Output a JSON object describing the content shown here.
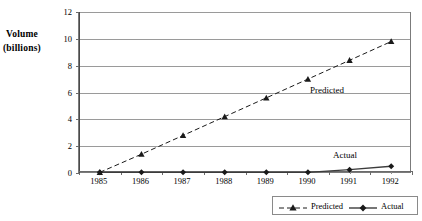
{
  "chart_data": {
    "type": "line",
    "title": "",
    "xlabel": "Year",
    "ylabel": "Volume (billions)",
    "ylabel_lines": [
      "Volume",
      "(billions)"
    ],
    "categories": [
      "1985",
      "1986",
      "1987",
      "1988",
      "1989",
      "1990",
      "1991",
      "1992"
    ],
    "x": [
      1985,
      1986,
      1987,
      1988,
      1989,
      1990,
      1991,
      1992
    ],
    "ylim": [
      0,
      12
    ],
    "yticks": [
      0,
      2,
      4,
      6,
      8,
      10,
      12
    ],
    "ytick_labels": [
      "0",
      "2",
      "4",
      "6",
      "8",
      "10",
      "12"
    ],
    "grid": true,
    "grid_axis": "y",
    "legend_position": "bottom-right",
    "series": [
      {
        "name": "Predicted",
        "values": [
          0.05,
          1.4,
          2.8,
          4.2,
          5.6,
          7.0,
          8.4,
          9.8
        ],
        "line_style": "dashed",
        "marker": "triangle",
        "color": "#1a1a1a"
      },
      {
        "name": "Actual",
        "values": [
          0.05,
          0.05,
          0.05,
          0.05,
          0.05,
          0.05,
          0.25,
          0.5
        ],
        "line_style": "solid",
        "marker": "diamond",
        "color": "#3c3c3c"
      }
    ],
    "annotations": [
      {
        "text": "Predicted",
        "x": 1990.05,
        "y": 6.1
      },
      {
        "text": "Actual",
        "x": 1990.6,
        "y": 1.3
      }
    ]
  },
  "legend": {
    "entries": [
      {
        "label": "Predicted",
        "style": "dashed",
        "marker": "triangle"
      },
      {
        "label": "Actual",
        "style": "solid",
        "marker": "diamond"
      }
    ]
  },
  "colors": {
    "predicted": "#1a1a1a",
    "actual": "#3c3c3c",
    "grid": "#9a9a9a",
    "frame": "#7b7b7b",
    "background": "#ffffff"
  }
}
